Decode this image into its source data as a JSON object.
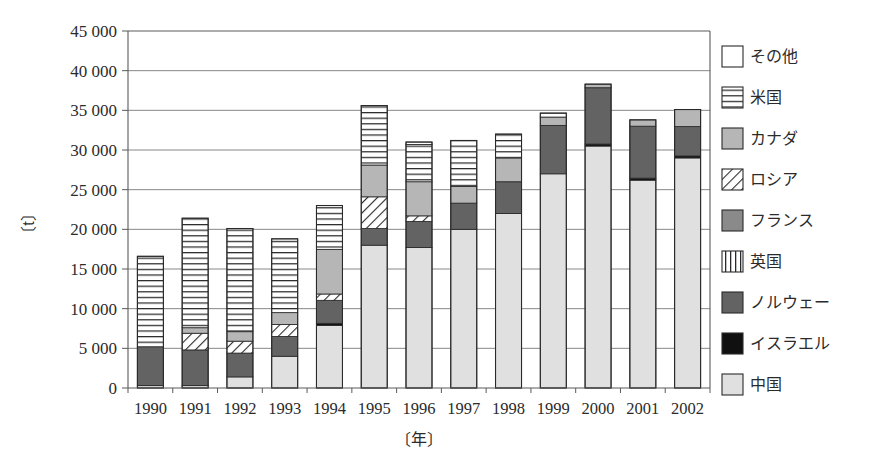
{
  "chart_data": {
    "type": "bar",
    "title": "",
    "subtitle": "",
    "xlabel": "〔年〕",
    "ylabel": "〔t〕",
    "stacked": true,
    "grid": true,
    "legend_position": "right",
    "ylim": [
      0,
      45000
    ],
    "ytick_step": 5000,
    "ytick_labels": [
      "0",
      "5 000",
      "10 000",
      "15 000",
      "20 000",
      "25 000",
      "30 000",
      "35 000",
      "40 000",
      "45 000"
    ],
    "ytick_values": [
      0,
      5000,
      10000,
      15000,
      20000,
      25000,
      30000,
      35000,
      40000,
      45000
    ],
    "categories": [
      "1990",
      "1991",
      "1992",
      "1993",
      "1994",
      "1995",
      "1996",
      "1997",
      "1998",
      "1999",
      "2000",
      "2001",
      "2002"
    ],
    "series": [
      {
        "name": "中国",
        "pattern": "solid-light-gray",
        "color": "#e0e0e0",
        "values": [
          300,
          300,
          1400,
          4000,
          7900,
          18000,
          17700,
          20000,
          22000,
          27000,
          30500,
          26200,
          29000
        ]
      },
      {
        "name": "イスラエル",
        "pattern": "solid-black",
        "color": "#101010",
        "values": [
          0,
          0,
          0,
          0,
          250,
          0,
          0,
          0,
          0,
          0,
          250,
          250,
          250
        ]
      },
      {
        "name": "ノルウェー",
        "pattern": "solid-dark-gray",
        "color": "#636363",
        "values": [
          4900,
          4500,
          3000,
          2500,
          2900,
          2100,
          3300,
          3300,
          4000,
          6100,
          7100,
          6550,
          3700
        ]
      },
      {
        "name": "英国",
        "pattern": "vertical-lines",
        "color": "#ffffff",
        "values": [
          0,
          0,
          0,
          0,
          0,
          0,
          0,
          0,
          0,
          0,
          0,
          0,
          0
        ]
      },
      {
        "name": "フランス",
        "pattern": "solid-mid-dark-gray",
        "color": "#8a8a8a",
        "values": [
          0,
          0,
          0,
          0,
          0,
          0,
          0,
          0,
          0,
          0,
          0,
          0,
          0
        ]
      },
      {
        "name": "ロシア",
        "pattern": "diagonal-hatch",
        "color": "#ffffff",
        "values": [
          0,
          2100,
          1500,
          1500,
          800,
          4000,
          700,
          0,
          0,
          0,
          0,
          0,
          0
        ]
      },
      {
        "name": "カナダ",
        "pattern": "solid-gray",
        "color": "#b6b6b6",
        "values": [
          0,
          700,
          1200,
          1500,
          5600,
          4000,
          4300,
          2100,
          3000,
          1050,
          450,
          800,
          2150
        ]
      },
      {
        "name": "米国",
        "pattern": "horizontal-lines",
        "color": "#ffffff",
        "values": [
          11400,
          13800,
          13000,
          9300,
          5550,
          7500,
          4700,
          5800,
          3000,
          500,
          0,
          0,
          0
        ]
      },
      {
        "name": "その他",
        "pattern": "solid-white",
        "color": "#ffffff",
        "values": [
          0,
          0,
          0,
          0,
          0,
          0,
          300,
          0,
          0,
          0,
          0,
          0,
          0
        ]
      }
    ],
    "totals": [
      16600,
      21400,
      20100,
      18800,
      23000,
      35600,
      31000,
      31200,
      32000,
      34650,
      38300,
      33800,
      35100
    ],
    "legend_entries": [
      {
        "label": "その他",
        "pattern": "solid-white"
      },
      {
        "label": "米国",
        "pattern": "horizontal-lines"
      },
      {
        "label": "カナダ",
        "pattern": "solid-gray"
      },
      {
        "label": "ロシア",
        "pattern": "diagonal-hatch"
      },
      {
        "label": "フランス",
        "pattern": "solid-mid-dark-gray"
      },
      {
        "label": "英国",
        "pattern": "vertical-lines"
      },
      {
        "label": "ノルウェー",
        "pattern": "solid-dark-gray"
      },
      {
        "label": "イスラエル",
        "pattern": "solid-black"
      },
      {
        "label": "中国",
        "pattern": "solid-light-gray"
      }
    ]
  },
  "plot": {
    "left": 128,
    "right": 710,
    "top": 31,
    "bottom": 388,
    "bar_width": 26
  },
  "legend": {
    "x_swatch": 722,
    "x_text": 750,
    "y_start": 46,
    "row_height": 41,
    "swatch_size": 21
  }
}
